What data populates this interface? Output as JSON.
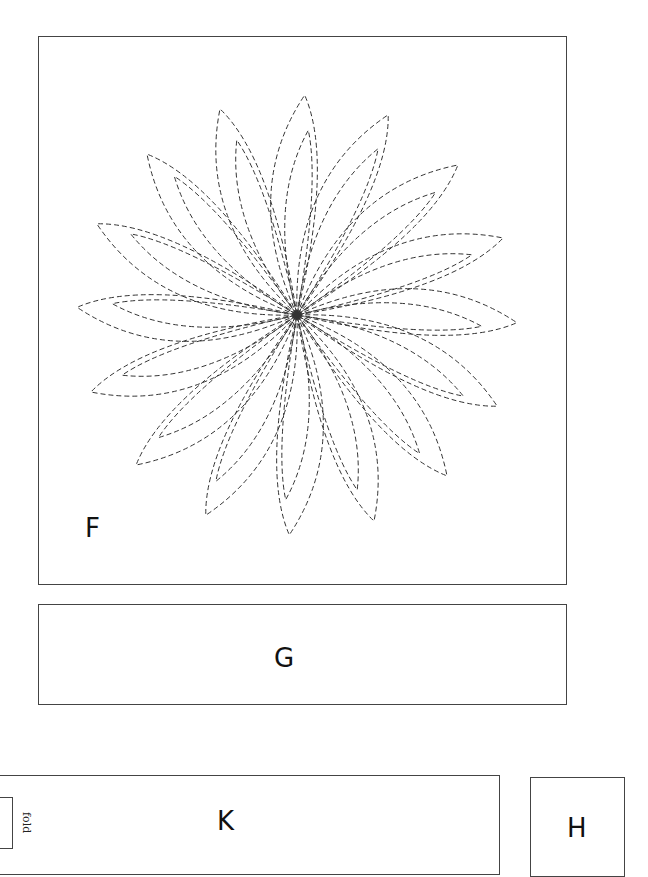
{
  "document": {
    "type": "pattern-templates",
    "pieces": [
      {
        "id": "F",
        "label": "F",
        "shape": "square",
        "content": "dashed-flower-applique"
      },
      {
        "id": "G",
        "label": "G",
        "shape": "rectangle"
      },
      {
        "id": "K",
        "label": "K",
        "shape": "rectangle",
        "note": "fold"
      },
      {
        "id": "H",
        "label": "H",
        "shape": "square"
      }
    ],
    "fold_label": "fold"
  },
  "flower": {
    "center": [
      297,
      315
    ],
    "petal_count": 16,
    "outer_radius": 220,
    "inner_radius": 185,
    "petal_width_deg": 26,
    "inner_width_deg": 17,
    "twist_deg": 10,
    "first_tip_angle_deg": -88,
    "stroke_color": "#333333",
    "dash": "5,3"
  },
  "colors": {
    "border": "#444444",
    "text": "#111111",
    "background": "#ffffff"
  }
}
